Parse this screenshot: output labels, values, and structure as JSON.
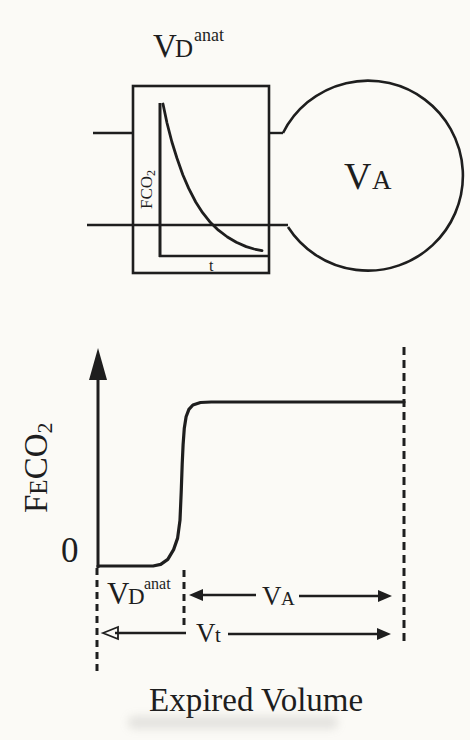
{
  "figure": {
    "colors": {
      "ink": "#1e1e1e",
      "paper": "#fbfaf6"
    },
    "model": {
      "title": {
        "base": "V",
        "sub": "D",
        "sup": "anat"
      },
      "inset_plot": {
        "ylabel_base": "F",
        "ylabel_mid": "CO",
        "ylabel_sub": "2",
        "xlabel": "t"
      },
      "balloon_label": {
        "base": "V",
        "sub": "A"
      }
    },
    "graph": {
      "ylabel_f": "F",
      "ylabel_e": "E",
      "ylabel_co": "CO",
      "ylabel_sub": "2",
      "origin_label": "0",
      "xaxis_title": "Expired Volume",
      "labels": {
        "dead_space": {
          "base": "V",
          "sub": "D",
          "sup": "anat"
        },
        "alveolar": {
          "base": "V",
          "sub": "A"
        },
        "tidal": {
          "base": "V",
          "sub": "t"
        }
      }
    }
  },
  "chart_data": [
    {
      "type": "line",
      "title": "Inset: CO2 fraction washout inside anatomical dead space",
      "xlabel": "t",
      "ylabel": "FCO2",
      "xlim": [
        0,
        1
      ],
      "ylim": [
        0,
        1
      ],
      "grid": false,
      "note": "Qualitative exponential decay, unlabeled axes (normalized 0-1)",
      "points": [
        [
          0,
          1
        ],
        [
          0.04,
          0.875
        ],
        [
          0.09,
          0.75
        ],
        [
          0.14,
          0.645
        ],
        [
          0.2,
          0.535
        ],
        [
          0.26,
          0.445
        ],
        [
          0.33,
          0.355
        ],
        [
          0.4,
          0.285
        ],
        [
          0.48,
          0.22
        ],
        [
          0.56,
          0.17
        ],
        [
          0.65,
          0.125
        ],
        [
          0.74,
          0.09
        ],
        [
          0.84,
          0.062
        ],
        [
          0.92,
          0.046
        ],
        [
          1,
          0.035
        ]
      ]
    },
    {
      "type": "line",
      "title": "Single-breath expired CO2 curve",
      "xlabel": "Expired Volume",
      "ylabel": "FECO2",
      "xlim": [
        0,
        1
      ],
      "ylim": [
        0,
        1
      ],
      "grid": false,
      "note": "Qualitative sigmoid: zero over anatomical dead space (~0 to 0.27 of Vt), steep rise, alveolar plateau to end of breath (normalized 0-1)",
      "annotations": [
        "VD anat spans 0 to ~0.28 of expired volume",
        "VA spans ~0.28 to 1.0",
        "Vt spans full breath 0 to 1.0"
      ],
      "points": [
        [
          0,
          0
        ],
        [
          0.1,
          0
        ],
        [
          0.18,
          0
        ],
        [
          0.205,
          0.01
        ],
        [
          0.228,
          0.04
        ],
        [
          0.247,
          0.1
        ],
        [
          0.26,
          0.17
        ],
        [
          0.268,
          0.28
        ],
        [
          0.272,
          0.45
        ],
        [
          0.275,
          0.62
        ],
        [
          0.278,
          0.74
        ],
        [
          0.282,
          0.84
        ],
        [
          0.288,
          0.91
        ],
        [
          0.297,
          0.955
        ],
        [
          0.31,
          0.982
        ],
        [
          0.335,
          0.997
        ],
        [
          0.37,
          1
        ],
        [
          0.6,
          1
        ],
        [
          0.8,
          1
        ],
        [
          1,
          1
        ]
      ]
    }
  ]
}
